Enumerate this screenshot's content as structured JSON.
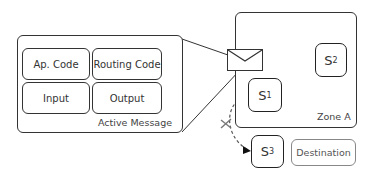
{
  "active_message": {
    "title": "Active Message",
    "cells": [
      {
        "label": "Ap. Code"
      },
      {
        "label": "Routing Code"
      },
      {
        "label": "Input"
      },
      {
        "label": "Output"
      }
    ]
  },
  "zone": {
    "label": "Zone A"
  },
  "states": [
    {
      "name": "S",
      "sub": "1"
    },
    {
      "name": "S",
      "sub": "2"
    },
    {
      "name": "S",
      "sub": "3"
    }
  ],
  "destination": {
    "label": "Destination"
  },
  "transitions": [
    {
      "from": "envelope",
      "to": "S2",
      "status": "allowed",
      "mark": "check"
    },
    {
      "from": "S1",
      "to": "S3",
      "status": "blocked",
      "mark": "cross"
    }
  ],
  "colors": {
    "line": "#333333",
    "dash": "#555555",
    "check": "#c8c8c8"
  }
}
